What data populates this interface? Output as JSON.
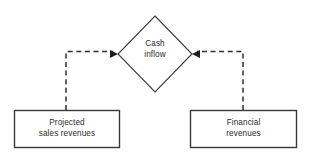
{
  "diagram": {
    "type": "flowchart",
    "background_color": "#ffffff",
    "stroke_color": "#3a3a3a",
    "text_color": "#2b2b2b",
    "nodes": {
      "decision": {
        "shape": "diamond",
        "label": "Cash\ninflow",
        "line1": "Cash",
        "line2": "inflow"
      },
      "left_box": {
        "shape": "rectangle",
        "label": "Projected\nsales revenues",
        "line1": "Projected",
        "line2": "sales revenues"
      },
      "right_box": {
        "shape": "rectangle",
        "label": "Financial\nrevenues",
        "line1": "Financial",
        "line2": "revenues"
      }
    },
    "edges": [
      {
        "id": "left-to-decision",
        "from": "left_box",
        "to": "decision",
        "style": "dashed",
        "arrowhead": "filled-triangle",
        "direction": "right"
      },
      {
        "id": "right-to-decision",
        "from": "right_box",
        "to": "decision",
        "style": "dashed",
        "arrowhead": "filled-triangle",
        "direction": "left"
      }
    ]
  }
}
